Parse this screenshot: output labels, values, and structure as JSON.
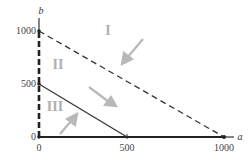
{
  "axes": {
    "x_label": "a",
    "y_label": "b",
    "x_ticks": [
      "0",
      "500",
      "1000"
    ],
    "y_ticks": [
      "0",
      "500",
      "1000"
    ]
  },
  "regions": [
    {
      "label": "I"
    },
    {
      "label": "II"
    },
    {
      "label": "III"
    }
  ],
  "lines": [
    {
      "name": "dashed-line",
      "from": [
        0,
        1000
      ],
      "to": [
        1000,
        0
      ],
      "style": "dashed"
    },
    {
      "name": "solid-line",
      "from": [
        0,
        500
      ],
      "to": [
        500,
        0
      ],
      "style": "solid"
    },
    {
      "name": "b-axis-dashed",
      "from": [
        0,
        0
      ],
      "to": [
        0,
        1000
      ],
      "style": "dashed-thick"
    },
    {
      "name": "a-axis-solid",
      "from": [
        0,
        0
      ],
      "to": [
        1000,
        0
      ],
      "style": "solid-thick"
    }
  ],
  "colors": {
    "line": "#333333",
    "arrow": "#b8b8b8",
    "region_label": "#b0b0b0"
  }
}
